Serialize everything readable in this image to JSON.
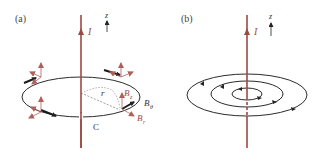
{
  "colors": {
    "wire": "#9b4a44",
    "loop": "#2b2b2b",
    "vector": "#b0605a",
    "dashed": "#888888",
    "text_dark": "#333333",
    "text_red": "#a04a44"
  },
  "panel_a": {
    "label": "(a)",
    "current_label": "I",
    "axis_label": "z",
    "radius_label": "r",
    "loop_label": "C",
    "bz_label": "B",
    "bz_sub": "z",
    "btheta_label": "B",
    "btheta_sub": "θ",
    "br_label": "B",
    "br_sub": "r"
  },
  "panel_b": {
    "label": "(b)",
    "current_label": "I",
    "axis_label": "z"
  }
}
